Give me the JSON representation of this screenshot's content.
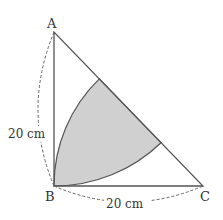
{
  "diagram": {
    "points": {
      "A": "A",
      "B": "B",
      "C": "C"
    },
    "side_ab": "20 cm",
    "side_bc": "20 cm",
    "colors": {
      "shade": "#d0d0d0",
      "line": "#555555"
    }
  }
}
